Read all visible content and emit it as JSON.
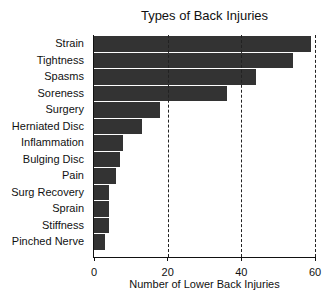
{
  "chart_data": {
    "type": "bar",
    "orientation": "horizontal",
    "title": "Types of Back Injuries",
    "xlabel": "Number of Lower Back Injuries",
    "ylabel": "",
    "xlim": [
      0,
      60
    ],
    "xticks": [
      0,
      20,
      40,
      60
    ],
    "grid": "vertical dashed at 20, 40, 60",
    "legend": null,
    "categories": [
      "Strain",
      "Tightness",
      "Spasms",
      "Soreness",
      "Surgery",
      "Herniated Disc",
      "Inflammation",
      "Bulging Disc",
      "Pain",
      "Surg Recovery",
      "Sprain",
      "Stiffness",
      "Pinched Nerve"
    ],
    "values": [
      59,
      54,
      44,
      36,
      18,
      13,
      8,
      7,
      6,
      4,
      4,
      4,
      3
    ],
    "bar_color": "#333333"
  }
}
